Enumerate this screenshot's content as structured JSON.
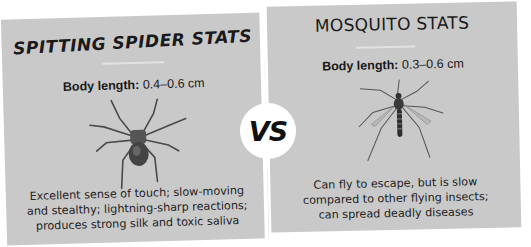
{
  "spider": {
    "title": "SPITTING SPIDER STATS",
    "body_length_label": "Body length:",
    "body_length_value": "0.4–0.6 cm",
    "description_lines": [
      "Excellent sense of touch; slow-moving",
      "and stealthy; lightning-sharp reactions;",
      "produces strong silk and toxic saliva"
    ],
    "illustration": "spider-illustration"
  },
  "mosquito": {
    "title": "MOSQUITO STATS",
    "body_length_label": "Body length:",
    "body_length_value": "0.3–0.6 cm",
    "description_lines": [
      "Can fly to escape, but is slow",
      "compared to other flying insects;",
      "can spread deadly diseases"
    ],
    "illustration": "mosquito-illustration"
  },
  "versus": {
    "label": "VS"
  },
  "colors": {
    "panel_bg": "#c9c9c9",
    "page_bg": "#ffffff",
    "text": "#1a1a1a"
  }
}
